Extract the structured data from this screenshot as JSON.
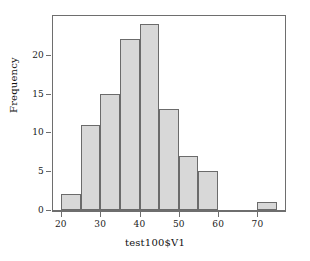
{
  "chart_data": {
    "type": "bar",
    "title": "",
    "subtitle": "",
    "xlabel": "test100$V1",
    "ylabel": "Frequency",
    "grid": false,
    "legend": false,
    "legend_position": "none",
    "bin_width": 5,
    "xlim": [
      18,
      77
    ],
    "ylim": [
      0,
      25
    ],
    "xticks": [
      20,
      30,
      40,
      50,
      60,
      70
    ],
    "xtick_labels": [
      "20",
      "30",
      "40",
      "50",
      "60",
      "70"
    ],
    "yticks": [
      0,
      5,
      10,
      15,
      20
    ],
    "ytick_labels": [
      "0",
      "5",
      "10",
      "15",
      "20"
    ],
    "categories": [
      "20-25",
      "25-30",
      "30-35",
      "35-40",
      "40-45",
      "45-50",
      "50-55",
      "55-60",
      "60-65",
      "65-70",
      "70-75"
    ],
    "bin_edges": [
      20,
      25,
      30,
      35,
      40,
      45,
      50,
      55,
      60,
      65,
      70,
      75
    ],
    "values": [
      2,
      11,
      15,
      22,
      24,
      13,
      7,
      5,
      0,
      0,
      1
    ],
    "bars": [
      {
        "label": "20-25",
        "start": 20,
        "end": 25,
        "value": 2
      },
      {
        "label": "25-30",
        "start": 25,
        "end": 30,
        "value": 11
      },
      {
        "label": "30-35",
        "start": 30,
        "end": 35,
        "value": 15
      },
      {
        "label": "35-40",
        "start": 35,
        "end": 40,
        "value": 22
      },
      {
        "label": "40-45",
        "start": 40,
        "end": 45,
        "value": 24
      },
      {
        "label": "45-50",
        "start": 45,
        "end": 50,
        "value": 13
      },
      {
        "label": "50-55",
        "start": 50,
        "end": 55,
        "value": 7
      },
      {
        "label": "55-60",
        "start": 55,
        "end": 60,
        "value": 5
      },
      {
        "label": "60-65",
        "start": 60,
        "end": 65,
        "value": 0
      },
      {
        "label": "65-70",
        "start": 65,
        "end": 70,
        "value": 0
      },
      {
        "label": "70-75",
        "start": 70,
        "end": 75,
        "value": 1
      }
    ],
    "total_count": 100,
    "colors": {
      "bar_fill": "#d8d8d8",
      "bar_border": "#6b6b6b",
      "axis": "#6e6e6e",
      "text": "#111111",
      "background": "#ffffff"
    }
  }
}
